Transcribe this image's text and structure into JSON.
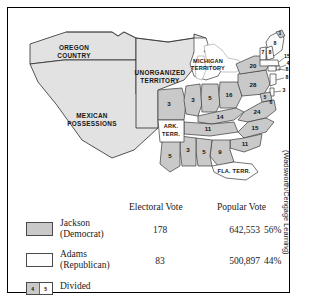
{
  "figure": {
    "credit": "(Wadsworth/Cengage Learning)"
  },
  "map": {
    "territories": [
      {
        "id": "oregon-country",
        "line1": "OREGON",
        "line2": "COUNTRY"
      },
      {
        "id": "mexican-possessions",
        "line1": "MEXICAN",
        "line2": "POSSESSIONS"
      },
      {
        "id": "unorganized",
        "line1": "UNORGANIZED",
        "line2": "TERRITORY"
      },
      {
        "id": "michigan-territory",
        "line1": "MICHIGAN",
        "line2": "TERRITORY"
      },
      {
        "id": "arkansas-territory",
        "line1": "ARK.",
        "line2": "TERR."
      },
      {
        "id": "florida-territory",
        "line1": "FLA. TERR.",
        "line2": ""
      }
    ],
    "states": [
      {
        "id": "missouri",
        "label": "3",
        "winner": "jackson"
      },
      {
        "id": "illinois",
        "label": "3",
        "winner": "jackson"
      },
      {
        "id": "indiana",
        "label": "5",
        "winner": "jackson"
      },
      {
        "id": "ohio",
        "label": "16",
        "winner": "jackson"
      },
      {
        "id": "kentucky",
        "label": "14",
        "winner": "jackson"
      },
      {
        "id": "tennessee",
        "label": "11",
        "winner": "jackson"
      },
      {
        "id": "virginia",
        "label": "24",
        "winner": "jackson"
      },
      {
        "id": "north-carolina",
        "label": "15",
        "winner": "jackson"
      },
      {
        "id": "south-carolina",
        "label": "11",
        "winner": "jackson"
      },
      {
        "id": "georgia",
        "label": "9",
        "winner": "jackson"
      },
      {
        "id": "alabama",
        "label": "5",
        "winner": "jackson"
      },
      {
        "id": "mississippi",
        "label": "3",
        "winner": "jackson"
      },
      {
        "id": "louisiana",
        "label": "5",
        "winner": "jackson"
      },
      {
        "id": "pennsylvania",
        "label": "28",
        "winner": "jackson"
      },
      {
        "id": "new-york",
        "label": "20",
        "winner": "jackson"
      },
      {
        "id": "new-jersey",
        "label": "8",
        "winner": "adams"
      },
      {
        "id": "delaware",
        "label": "3",
        "winner": "adams"
      },
      {
        "id": "maryland",
        "label": "5",
        "winner": "divided-jackson"
      },
      {
        "id": "maryland-adams",
        "label": "6",
        "winner": "divided-adams"
      },
      {
        "id": "connecticut",
        "label": "8",
        "winner": "adams"
      },
      {
        "id": "rhode-island",
        "label": "4",
        "winner": "adams"
      },
      {
        "id": "massachusetts",
        "label": "15",
        "winner": "adams"
      },
      {
        "id": "vermont",
        "label": "7",
        "winner": "adams"
      },
      {
        "id": "new-hampshire",
        "label": "8",
        "winner": "adams"
      },
      {
        "id": "maine-jackson",
        "label": "1",
        "winner": "divided-jackson"
      },
      {
        "id": "maine-adams",
        "label": "8",
        "winner": "divided-adams"
      }
    ]
  },
  "legend": {
    "column_headers": {
      "electoral": "Electoral Vote",
      "popular": "Popular Vote"
    },
    "rows": [
      {
        "candidate": "Jackson",
        "party": "(Democrat)",
        "electoral_vote": "178",
        "popular_vote": "642,553",
        "percent": "56%",
        "swatch_color": "#c9c9c9"
      },
      {
        "candidate": "Adams",
        "party": "(Republican)",
        "electoral_vote": "83",
        "popular_vote": "500,897",
        "percent": "44%",
        "swatch_color": "#fdfdfd"
      }
    ],
    "divided": {
      "label": "Divided",
      "left_mark": "4",
      "right_mark": "5"
    }
  }
}
